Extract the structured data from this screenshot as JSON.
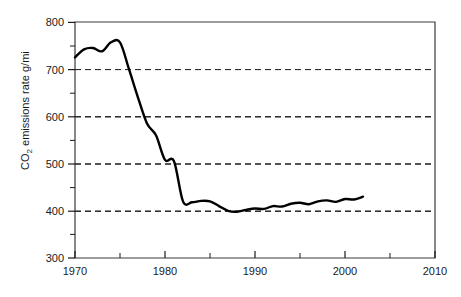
{
  "chart_data": {
    "type": "line",
    "title": "",
    "xlabel": "",
    "ylabel": "CO2 emissions rate g/mi",
    "ylabel_parts": {
      "prefix": "CO",
      "subscript": "2",
      "suffix": " emissions rate g/mi"
    },
    "xlim": [
      1970,
      2010
    ],
    "ylim": [
      300,
      800
    ],
    "grid": "horizontal-dashed",
    "gridlines_y": [
      400,
      500,
      600,
      700
    ],
    "legend": "none",
    "xticks_major": [
      1970,
      1980,
      1990,
      2000,
      2010
    ],
    "xtick_labels": [
      "1970",
      "1980",
      "1990",
      "2000",
      "2010"
    ],
    "xticks_minor": [
      1975,
      1985,
      1995,
      2005
    ],
    "yticks_major": [
      300,
      400,
      500,
      600,
      700,
      800
    ],
    "ytick_labels": [
      "300",
      "400",
      "500",
      "600",
      "700",
      "800"
    ],
    "yticks_minor": [
      350,
      450,
      550,
      650,
      750
    ],
    "series": [
      {
        "name": "CO2 emissions rate",
        "color": "#000000",
        "x": [
          1970,
          1971,
          1972,
          1973,
          1974,
          1975,
          1976,
          1977,
          1978,
          1979,
          1980,
          1981,
          1982,
          1983,
          1984,
          1985,
          1986,
          1987,
          1988,
          1989,
          1990,
          1991,
          1992,
          1993,
          1994,
          1995,
          1996,
          1997,
          1998,
          1999,
          2000,
          2001,
          2002
        ],
        "values": [
          725,
          742,
          745,
          738,
          757,
          757,
          700,
          640,
          585,
          560,
          508,
          505,
          420,
          418,
          421,
          420,
          410,
          400,
          398,
          402,
          405,
          404,
          410,
          409,
          415,
          417,
          414,
          420,
          422,
          419,
          425,
          424,
          430
        ]
      }
    ]
  }
}
